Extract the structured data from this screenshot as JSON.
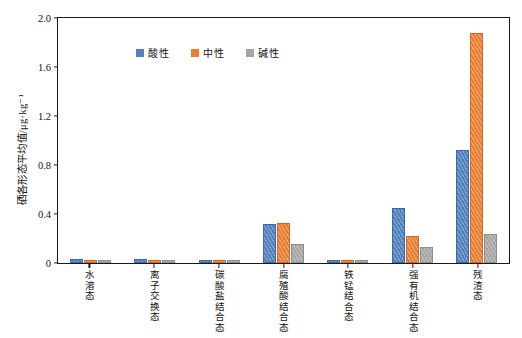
{
  "chart_data": {
    "type": "bar",
    "title": "",
    "xlabel": "",
    "ylabel": "硒各形态平均值/μg·kg⁻¹",
    "ylim": [
      0,
      2.0
    ],
    "yticks": [
      "0",
      "0.4",
      "0.8",
      "1.2",
      "1.6",
      "2.0"
    ],
    "ytick_values": [
      0,
      0.4,
      0.8,
      1.2,
      1.6,
      2.0
    ],
    "grid": false,
    "legend_position": "top-left",
    "categories": [
      "水溶态",
      "离子交换态",
      "碳酸盐结合态",
      "腐殖酸结合态",
      "铁锰结合态",
      "强有机结合态",
      "残渣态"
    ],
    "series": [
      {
        "name": "酸性",
        "color": "#4E81BD",
        "values": [
          0.015,
          0.013,
          0.012,
          0.3,
          0.01,
          0.43,
          0.9
        ]
      },
      {
        "name": "中性",
        "color": "#ED7D31",
        "values": [
          0.008,
          0.006,
          0.006,
          0.31,
          0.006,
          0.2,
          1.85
        ]
      },
      {
        "name": "碱性",
        "color": "#A6A6A6",
        "values": [
          0.006,
          0.005,
          0.005,
          0.135,
          0.005,
          0.11,
          0.22
        ]
      }
    ]
  },
  "legend": {
    "items": [
      {
        "label": "酸性",
        "key": "acid"
      },
      {
        "label": "中性",
        "key": "neutral"
      },
      {
        "label": "碱性",
        "key": "alkaline"
      }
    ]
  },
  "axis": {
    "y_title": "硒各形态平均值/μg·kg⁻¹"
  }
}
